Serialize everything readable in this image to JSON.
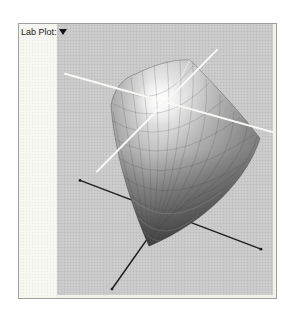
{
  "panel": {
    "label": "Lab Plot:",
    "dropdown": {
      "icon": "triangle-down",
      "expanded": false
    }
  },
  "plot": {
    "kind": "3d-surface-gamut",
    "surface_style": "grayscale shaded wireframe mesh",
    "light_axes": 2,
    "dark_axes": 2
  },
  "colors": {
    "page_bg": "#ffffff",
    "panel_border": "#9f9f9f",
    "sidebar_bg": "#f7f7f2",
    "plot_bg": "#c9c9c9",
    "plot_dot": "#b9b9b9",
    "axis_light": "#f8f8f5",
    "axis_dark": "#1f1f1f",
    "surface_highlight": "#f7f7f7",
    "surface_shadow": "#4a4a4a"
  }
}
